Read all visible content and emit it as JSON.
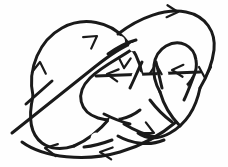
{
  "figure": {
    "kind": "oriented-knot-diagram",
    "title": "Oriented knot diagram",
    "background_color": "#fefefe",
    "ink_color": "#1a1a1a",
    "width": 228,
    "height": 167,
    "stroke_width": 3.0,
    "crossing_gap": 7,
    "arrow_count": 9,
    "crossing_count": 8
  },
  "chart_data": {
    "type": "diagram",
    "title": "Oriented knot diagram",
    "xlabel": "",
    "ylabel": "",
    "xlim": [
      0,
      228
    ],
    "ylim": [
      0,
      167
    ],
    "grid": false,
    "legend": "none",
    "series": [
      {
        "name": "main-loop-left",
        "path": "M 42 86 C 36 56 60 24 88 22 C 112 20 128 34 132 52"
      },
      {
        "name": "main-loop-outer-left-lower",
        "path": "M 42 86 C 40 112 46 134 62 144 C 80 155 104 152 122 140"
      },
      {
        "name": "top-arc-right",
        "path": "M 118 30 C 142 14 168 8 190 16 C 212 24 216 48 206 64"
      },
      {
        "name": "right-small-loop",
        "path": "M 152 76 C 148 52 166 40 182 46 C 196 52 196 70 186 82"
      },
      {
        "name": "right-lower-sweep",
        "path": "M 206 64 C 206 92 192 118 168 132 C 150 142 132 140 120 132"
      },
      {
        "name": "long-diagonal",
        "path": "M 18 130 C 44 108 76 80 110 58 C 118 52 126 48 132 46"
      },
      {
        "name": "center-loop",
        "path": "M 132 54 C 116 62 98 70 88 84 C 78 98 84 114 100 120"
      },
      {
        "name": "bottom-arc",
        "path": "M 28 140 C 48 156 92 160 126 148 C 150 140 164 128 172 118"
      }
    ],
    "arrows": [
      {
        "id": "arrow-left-up",
        "x": 40,
        "y": 62,
        "angle": -80,
        "label": "up"
      },
      {
        "id": "arrow-diagonal-ne",
        "x": 94,
        "y": 38,
        "angle": -34,
        "label": "northeast"
      },
      {
        "id": "arrow-top-right",
        "x": 176,
        "y": 13,
        "angle": 2,
        "label": "right"
      },
      {
        "id": "arrow-center-down",
        "x": 124,
        "y": 66,
        "angle": 92,
        "label": "down"
      },
      {
        "id": "arrow-center-left",
        "x": 108,
        "y": 73,
        "angle": 186,
        "label": "left"
      },
      {
        "id": "arrow-small-loop-up",
        "x": 156,
        "y": 66,
        "angle": -86,
        "label": "up"
      },
      {
        "id": "arrow-mid-right-left",
        "x": 188,
        "y": 70,
        "angle": 196,
        "label": "left"
      },
      {
        "id": "arrow-far-right-down",
        "x": 205,
        "y": 76,
        "angle": 88,
        "label": "down"
      },
      {
        "id": "arrow-bottom-left-1",
        "x": 48,
        "y": 147,
        "angle": 188,
        "label": "left"
      },
      {
        "id": "arrow-bottom-left-2",
        "x": 104,
        "y": 150,
        "angle": 186,
        "label": "left"
      },
      {
        "id": "arrow-bottom-right",
        "x": 152,
        "y": 131,
        "angle": 28,
        "label": "right-down"
      }
    ]
  }
}
